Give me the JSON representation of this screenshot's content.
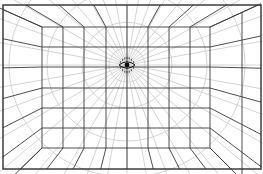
{
  "diagram": {
    "title": "",
    "vanishing_point": {
      "x": 127,
      "y": 65,
      "marker": "eye-icon"
    },
    "colors": {
      "background": "#ffffff",
      "grid_lines": "#3a3a3a",
      "guide_lines": "#cfcfcf",
      "frame": "#2e2e2e",
      "eye": "#111111"
    },
    "frame": {
      "x1": 3,
      "y1": 5,
      "x2": 261,
      "y2": 169
    },
    "back_wall": {
      "x1": 42,
      "y1": 27,
      "x2": 210,
      "y2": 148,
      "vertical_lines_x": [
        42,
        63,
        84,
        106,
        127,
        148,
        169,
        190,
        210
      ],
      "horizontal_lines_y": [
        27,
        47,
        67,
        88,
        108,
        128,
        148
      ]
    },
    "right_wall_edge_x": 242,
    "concentric_circle_radii": [
      18,
      45,
      80,
      118
    ],
    "radial_guide_count": 36
  }
}
